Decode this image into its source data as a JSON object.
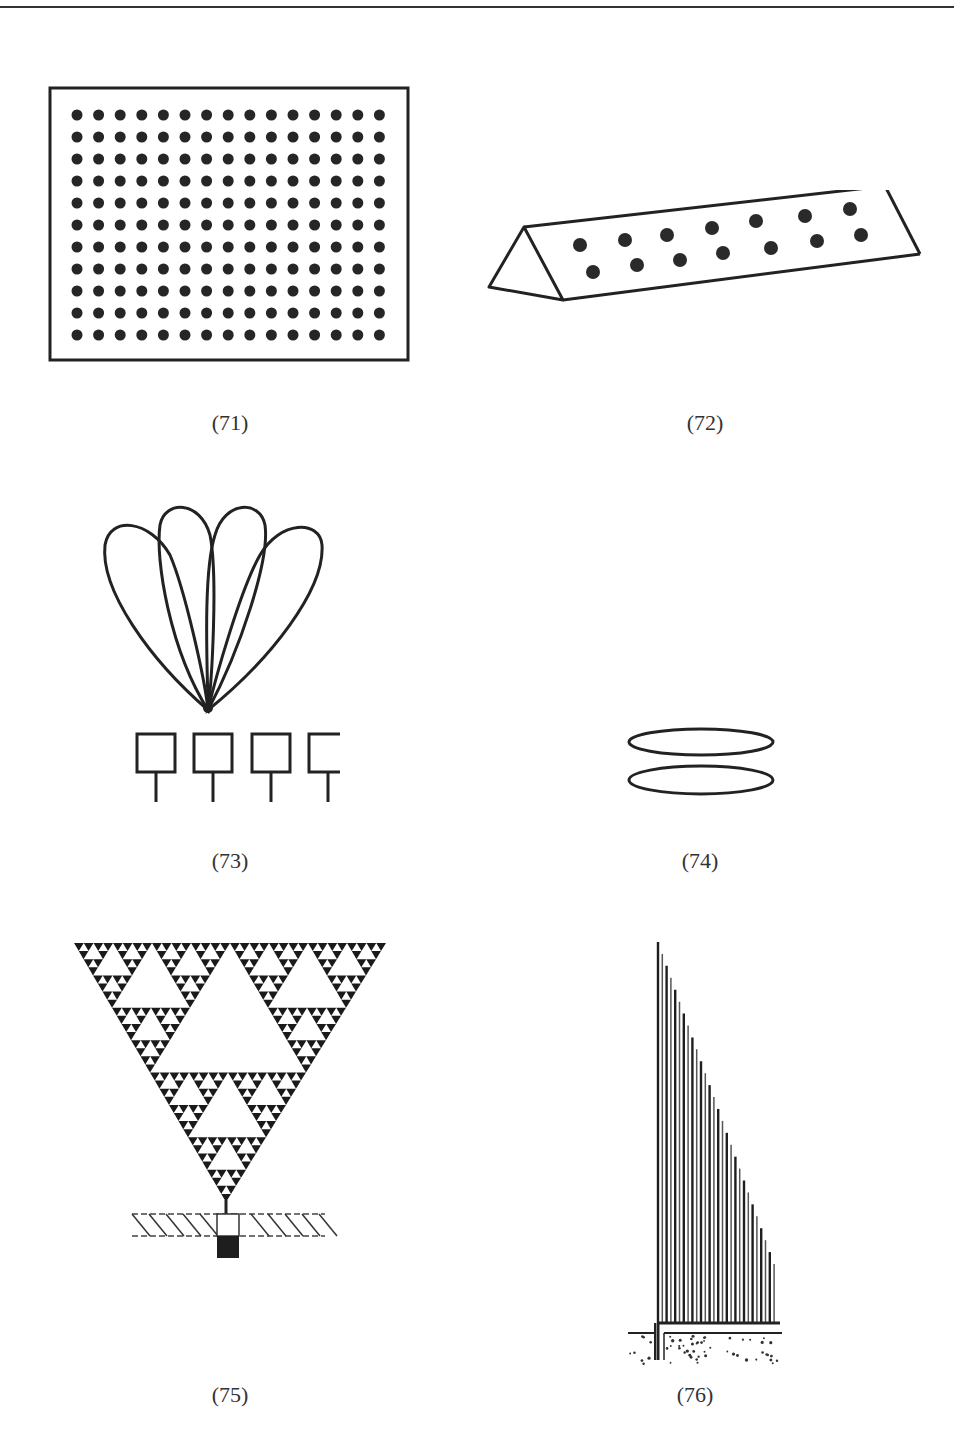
{
  "page": {
    "top_rule": true
  },
  "figures": [
    {
      "id": "71",
      "caption": "(71)",
      "description": "rectangular panel with grid of dots",
      "grid": {
        "rows": 11,
        "cols": 15
      }
    },
    {
      "id": "72",
      "caption": "(72)",
      "description": "triangular prism with two staggered rows of dots",
      "rows": [
        7,
        7
      ]
    },
    {
      "id": "73",
      "caption": "(73)",
      "description": "four-lobe beam pattern above four square antenna elements",
      "lobes": 4,
      "elements": 4
    },
    {
      "id": "74",
      "caption": "(74)",
      "description": "two stacked flat ellipses"
    },
    {
      "id": "75",
      "caption": "(75)",
      "description": "inverted Sierpinski triangle fractal on a post above hatched ground",
      "levels": 5
    },
    {
      "id": "76",
      "caption": "(76)",
      "description": "right-triangle array of vertical lines decreasing in height above ground line"
    }
  ]
}
